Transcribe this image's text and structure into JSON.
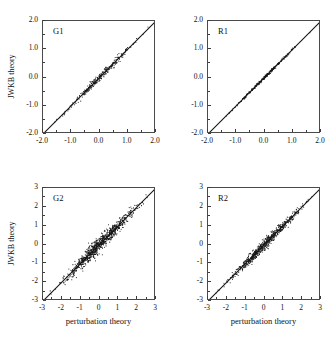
{
  "figure": {
    "background": "#ffffff",
    "axis_color": "#4a4a4a",
    "data_color": "#161616"
  },
  "labels": {
    "ylabel": "JWKB theory",
    "xlabel": "perturbation theory"
  },
  "panels": [
    {
      "id": "G1",
      "label": "G1",
      "position": "top-left",
      "show_ylabel": true,
      "show_xlabel": false,
      "ticks_x": [
        "-2.0",
        "-1.0",
        "0.0",
        "1.0",
        "2.0"
      ],
      "ticks_y": [
        "2.0",
        "1.0",
        "0.0",
        "-1.0",
        "-2.0"
      ]
    },
    {
      "id": "R1",
      "label": "R1",
      "position": "top-right",
      "show_ylabel": false,
      "show_xlabel": false,
      "ticks_x": [
        "-2.0",
        "-1.0",
        "0.0",
        "1.0",
        "2.0"
      ],
      "ticks_y": [
        "2.0",
        "1.0",
        "0.0",
        "-1.0",
        "-2.0"
      ]
    },
    {
      "id": "G2",
      "label": "G2",
      "position": "bottom-left",
      "show_ylabel": true,
      "show_xlabel": true,
      "ticks_x": [
        "-3",
        "-2",
        "-1",
        "0",
        "1",
        "2",
        "3"
      ],
      "ticks_y": [
        "3",
        "2",
        "1",
        "0",
        "-1",
        "-2",
        "-3"
      ]
    },
    {
      "id": "R2",
      "label": "R2",
      "position": "bottom-right",
      "show_ylabel": false,
      "show_xlabel": true,
      "ticks_x": [
        "-3",
        "-2",
        "-1",
        "0",
        "1",
        "2",
        "3"
      ],
      "ticks_y": [
        "3",
        "2",
        "1",
        "0",
        "-1",
        "-2",
        "-3"
      ]
    }
  ],
  "chart_data": [
    {
      "type": "scatter",
      "panel": "G1",
      "title": "G1",
      "xlabel": "perturbation theory",
      "ylabel": "JWKB theory",
      "xlim": [
        -2.0,
        2.0
      ],
      "ylim": [
        -2.0,
        2.0
      ],
      "xticks": [
        -2.0,
        -1.0,
        0.0,
        1.0,
        2.0
      ],
      "yticks": [
        -2.0,
        -1.0,
        0.0,
        1.0,
        2.0
      ],
      "grid": false,
      "legend": "none",
      "reference_line": {
        "type": "identity",
        "from": [
          -2.0,
          -2.0
        ],
        "to": [
          2.0,
          2.0
        ]
      },
      "scatter_spread": 0.055,
      "n_points": 300,
      "note": "points lie tightly on y = x, slight spread below the line for x between -0.5 and 1.5"
    },
    {
      "type": "scatter",
      "panel": "R1",
      "title": "R1",
      "xlabel": "perturbation theory",
      "ylabel": "JWKB theory",
      "xlim": [
        -2.0,
        2.0
      ],
      "ylim": [
        -2.0,
        2.0
      ],
      "xticks": [
        -2.0,
        -1.0,
        0.0,
        1.0,
        2.0
      ],
      "yticks": [
        -2.0,
        -1.0,
        0.0,
        1.0,
        2.0
      ],
      "grid": false,
      "legend": "none",
      "reference_line": {
        "type": "identity",
        "from": [
          -2.0,
          -2.0
        ],
        "to": [
          2.0,
          2.0
        ]
      },
      "scatter_spread": 0.022,
      "n_points": 260,
      "note": "nearly perfect agreement, points indistinguishable from the identity line"
    },
    {
      "type": "scatter",
      "panel": "G2",
      "title": "G2",
      "xlabel": "perturbation theory",
      "ylabel": "JWKB theory",
      "xlim": [
        -3,
        3
      ],
      "ylim": [
        -3,
        3
      ],
      "xticks": [
        -3,
        -2,
        -1,
        0,
        1,
        2,
        3
      ],
      "yticks": [
        -3,
        -2,
        -1,
        0,
        1,
        2,
        3
      ],
      "grid": false,
      "legend": "none",
      "reference_line": {
        "type": "identity",
        "from": [
          -3,
          -3
        ],
        "to": [
          3,
          3
        ]
      },
      "scatter_spread": 0.16,
      "n_points": 900,
      "note": "dense cloud along y = x, widest scatter between -1.5 and 1.5"
    },
    {
      "type": "scatter",
      "panel": "R2",
      "title": "R2",
      "xlabel": "perturbation theory",
      "ylabel": "JWKB theory",
      "xlim": [
        -3,
        3
      ],
      "ylim": [
        -3,
        3
      ],
      "xticks": [
        -3,
        -2,
        -1,
        0,
        1,
        2,
        3
      ],
      "yticks": [
        -3,
        -2,
        -1,
        0,
        1,
        2,
        3
      ],
      "grid": false,
      "legend": "none",
      "reference_line": {
        "type": "identity",
        "from": [
          -3,
          -3
        ],
        "to": [
          3,
          3
        ]
      },
      "scatter_spread": 0.11,
      "n_points": 700,
      "note": "dense cloud along y = x, moderate scatter concentrated between -1.5 and 1"
    }
  ]
}
